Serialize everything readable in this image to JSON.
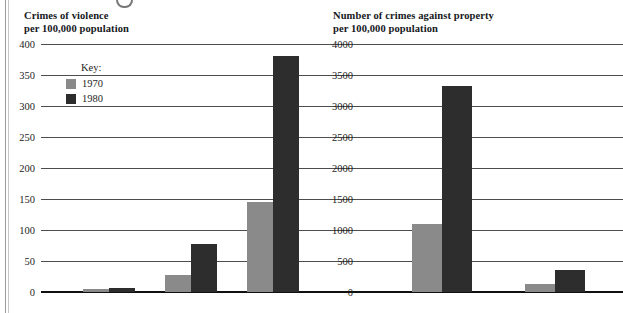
{
  "page": {
    "background_color": "#ffffff",
    "series_colors": {
      "1970": "#8a8a8a",
      "1980": "#2d2d2d"
    }
  },
  "legend": {
    "title": "Key:",
    "entries": [
      {
        "label": "1970",
        "color": "#8a8a8a",
        "swatch_name": "legend-swatch-1970"
      },
      {
        "label": "1980",
        "color": "#2d2d2d",
        "swatch_name": "legend-swatch-1980"
      }
    ]
  },
  "chart_data": [
    {
      "type": "bar",
      "id": "crimes-of-violence",
      "title": "Crimes of violence\nper 100,000 population",
      "title_line1": "Crimes of violence",
      "title_line2": "per 100,000 population",
      "xlabel": "",
      "ylabel": "per 100,000 population",
      "ylim": [
        0,
        400
      ],
      "yticks": [
        0,
        50,
        100,
        150,
        200,
        250,
        300,
        350,
        400
      ],
      "ytick_labels": [
        "0",
        "50",
        "100",
        "150",
        "200",
        "250",
        "300",
        "350",
        "400"
      ],
      "grid": true,
      "legend_position": "inside-upper-left",
      "categories": [
        "Murder",
        "Robbery",
        "Assault"
      ],
      "series": [
        {
          "name": "1970",
          "color": "#8a8a8a",
          "values": [
            5,
            27,
            145
          ]
        },
        {
          "name": "1980",
          "color": "#2d2d2d",
          "values": [
            6,
            77,
            380
          ]
        }
      ]
    },
    {
      "type": "bar",
      "id": "crimes-against-property",
      "title": "Number of crimes against property\nper 100,000 population",
      "title_line1": "Number of crimes against property",
      "title_line2": "per 100,000 population",
      "xlabel": "",
      "ylabel": "per 100,000 population",
      "ylim": [
        0,
        4000
      ],
      "yticks": [
        0,
        500,
        1000,
        1500,
        2000,
        2500,
        3000,
        3500,
        4000
      ],
      "ytick_labels": [
        "0",
        "500",
        "1000",
        "1500",
        "2000",
        "2500",
        "3000",
        "3500",
        "4000"
      ],
      "grid": true,
      "legend_position": "inside-upper-right",
      "categories": [
        "Theft",
        "Fraud"
      ],
      "series": [
        {
          "name": "1970",
          "color": "#8a8a8a",
          "values": [
            1090,
            130
          ]
        },
        {
          "name": "1980",
          "color": "#2d2d2d",
          "values": [
            3320,
            350
          ]
        }
      ]
    }
  ]
}
